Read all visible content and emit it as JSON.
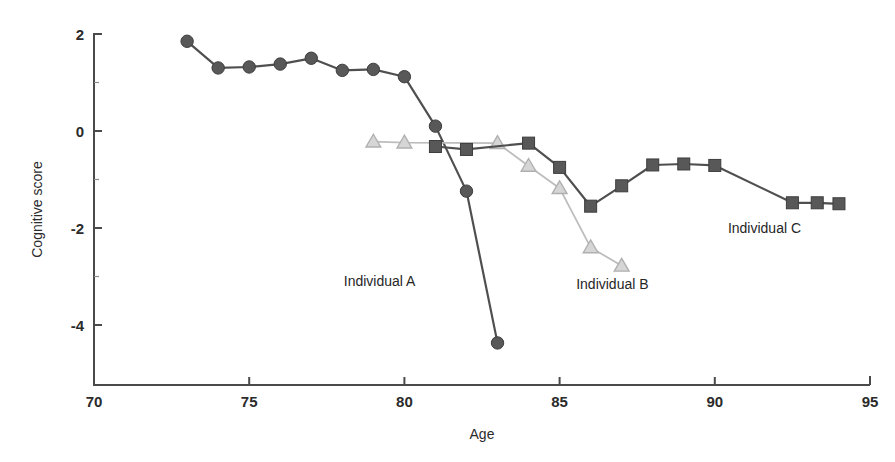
{
  "chart_data": {
    "type": "line",
    "title": "",
    "xlabel": "Age",
    "ylabel": "Cognitive score",
    "xlim": [
      70,
      95
    ],
    "ylim": [
      -5,
      2
    ],
    "xticks": [
      70,
      75,
      80,
      85,
      90,
      95
    ],
    "yticks": [
      2,
      0,
      -2,
      -4
    ],
    "xtick_labels": [
      "70",
      "75",
      "80",
      "85",
      "90",
      "95"
    ],
    "ytick_labels": [
      "2",
      "0",
      "-2",
      "-4"
    ],
    "grid": false,
    "legend_position": "inline-annotations",
    "series": [
      {
        "name": "Individual A",
        "marker": "circle",
        "color": "#585858",
        "x": [
          73,
          74,
          75,
          76,
          77,
          78,
          79,
          80,
          81,
          82,
          83
        ],
        "y": [
          1.85,
          1.3,
          1.32,
          1.38,
          1.5,
          1.25,
          1.27,
          1.12,
          0.1,
          -1.24,
          -4.37
        ]
      },
      {
        "name": "Individual B",
        "marker": "triangle",
        "color": "#d6d6d6",
        "x": [
          79,
          80,
          83,
          84,
          85,
          86,
          87
        ],
        "y": [
          -0.22,
          -0.24,
          -0.25,
          -0.72,
          -1.18,
          -2.4,
          -2.78
        ]
      },
      {
        "name": "Individual C",
        "marker": "square",
        "color": "#585858",
        "x": [
          81,
          82,
          84,
          85,
          86,
          87,
          88,
          89,
          90,
          92.5,
          93.3,
          94
        ],
        "y": [
          -0.32,
          -0.38,
          -0.25,
          -0.75,
          -1.55,
          -1.13,
          -0.7,
          -0.68,
          -0.71,
          -1.48,
          -1.48,
          -1.5
        ]
      }
    ],
    "annotations": [
      {
        "text": "Individual A",
        "x": 79.2,
        "y": -3.2
      },
      {
        "text": "Individual B",
        "x": 86.7,
        "y": -3.25
      },
      {
        "text": "Individual C",
        "x": 91.6,
        "y": -2.1
      }
    ]
  },
  "axes": {
    "x_title": "Age",
    "y_title": "Cognitive score"
  }
}
